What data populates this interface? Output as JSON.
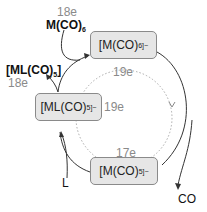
{
  "diagram": {
    "species": {
      "top": {
        "formula": "[M(CO)",
        "sub": "6",
        "sup": "]−"
      },
      "left": {
        "formula": "[ML(CO)",
        "sub": "5",
        "sup": "]−"
      },
      "bottom": {
        "formula": "[M(CO)",
        "sub": "5",
        "sup": "]−"
      }
    },
    "electron_counts": {
      "top": "19e",
      "left": "19e",
      "bottom": "17e",
      "reagent_top": "18e",
      "product_left": "18e"
    },
    "external": {
      "reagent_in": {
        "formula": "M(CO)",
        "sub": "6"
      },
      "product_out": {
        "formula": "[ML(CO)",
        "sub": "5",
        "sup": "]"
      },
      "ligand_in": "L",
      "co_out": "CO"
    },
    "colors": {
      "box_fill": "#e6e6e6",
      "box_border": "#8a8a8a",
      "line": "#333333",
      "dotted": "#aaaaaa",
      "count_text": "#8a8a8a"
    }
  }
}
